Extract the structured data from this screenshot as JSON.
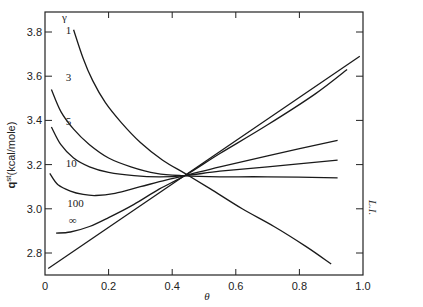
{
  "chart_data": {
    "type": "line",
    "title": "",
    "xlabel": "θ",
    "ylabel": "q^st (kcal/mole)",
    "ylabel_main": "q",
    "ylabel_sup": "st",
    "ylabel_unit": "(kcal/mole)",
    "legend_title": "γ",
    "xlim": [
      0,
      1.0
    ],
    "ylim": [
      2.7,
      3.89
    ],
    "xticks": [
      0,
      0.2,
      0.4,
      0.6,
      0.8,
      1.0
    ],
    "xtick_labels": [
      "0",
      "0.2",
      "0.4",
      "0.6",
      "0.8",
      "1.0"
    ],
    "yticks": [
      2.8,
      3.0,
      3.2,
      3.4,
      3.6,
      3.8
    ],
    "ytick_labels": [
      "2.8",
      "3.0",
      "3.2",
      "3.4",
      "3.6",
      "3.8"
    ],
    "grid": false,
    "series": [
      {
        "name": "1",
        "label_pos": [
          0.065,
          3.79
        ],
        "x": [
          0.09,
          0.12,
          0.15,
          0.19,
          0.24,
          0.3,
          0.37,
          0.44,
          0.52,
          0.62,
          0.72,
          0.82,
          0.9
        ],
        "y": [
          3.81,
          3.68,
          3.58,
          3.48,
          3.39,
          3.3,
          3.22,
          3.16,
          3.09,
          3.0,
          2.92,
          2.83,
          2.75
        ]
      },
      {
        "name": "3",
        "label_pos": [
          0.065,
          3.58
        ],
        "x": [
          0.02,
          0.05,
          0.09,
          0.14,
          0.2,
          0.27,
          0.35,
          0.43,
          0.55,
          0.7,
          0.92
        ],
        "y": [
          3.54,
          3.44,
          3.36,
          3.29,
          3.23,
          3.19,
          3.16,
          3.15,
          3.145,
          3.145,
          3.14
        ]
      },
      {
        "name": "5",
        "label_pos": [
          0.065,
          3.38
        ],
        "x": [
          0.02,
          0.05,
          0.09,
          0.14,
          0.2,
          0.28,
          0.36,
          0.44,
          0.55,
          0.7,
          0.92
        ],
        "y": [
          3.37,
          3.29,
          3.23,
          3.19,
          3.165,
          3.15,
          3.145,
          3.15,
          3.17,
          3.19,
          3.22
        ]
      },
      {
        "name": "10",
        "label_pos": [
          0.065,
          3.19
        ],
        "x": [
          0.015,
          0.04,
          0.08,
          0.12,
          0.16,
          0.22,
          0.3,
          0.38,
          0.44,
          0.55,
          0.7,
          0.92
        ],
        "y": [
          3.16,
          3.11,
          3.08,
          3.065,
          3.06,
          3.07,
          3.1,
          3.13,
          3.15,
          3.19,
          3.24,
          3.31
        ]
      },
      {
        "name": "100",
        "label_pos": [
          0.07,
          3.01
        ],
        "x": [
          0.035,
          0.08,
          0.14,
          0.2,
          0.28,
          0.36,
          0.44,
          0.55,
          0.7,
          0.85,
          0.95
        ],
        "y": [
          2.89,
          2.895,
          2.92,
          2.96,
          3.02,
          3.09,
          3.15,
          3.25,
          3.38,
          3.52,
          3.63
        ]
      },
      {
        "name": "∞",
        "label_pos": [
          0.075,
          2.93
        ],
        "x": [
          0.01,
          0.99
        ],
        "y": [
          2.73,
          3.69
        ]
      }
    ]
  },
  "side_note": "L.I."
}
